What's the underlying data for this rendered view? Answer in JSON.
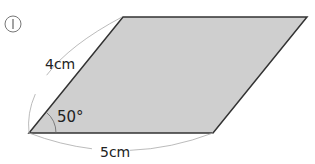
{
  "problem": {
    "number": "1",
    "number_display": "Ⅰ"
  },
  "figure": {
    "shape": "parallelogram",
    "fill_color": "#cfcfcf",
    "stroke_color": "#333333",
    "side_left_label": "4cm",
    "side_bottom_label": "5cm",
    "angle_label": "50°"
  }
}
